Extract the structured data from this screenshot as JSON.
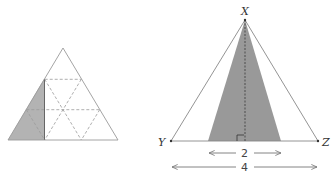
{
  "figures": {
    "left": {
      "description": "Equilateral triangle subdivided into 9 small triangles by dashed lines, with a shaded right-triangle region on the left",
      "colors": {
        "fill": "#b3b3b3",
        "stroke": "#9a9a9a",
        "dashed": "#9a9a9a"
      }
    },
    "right": {
      "vertices": {
        "top": "X",
        "left": "Y",
        "right": "Z"
      },
      "inner_base_label": "2",
      "outer_base_label": "4",
      "colors": {
        "fill": "#999999",
        "stroke": "#888888",
        "text": "#333333"
      }
    }
  }
}
